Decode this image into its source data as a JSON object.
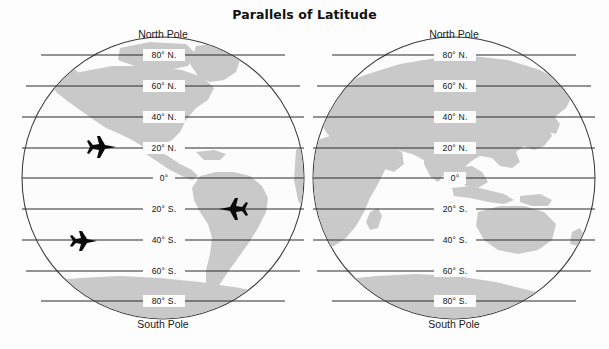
{
  "figure": {
    "title": "Parallels of Latitude",
    "background_color": "#fdfdfd",
    "land_color": "#c9c9c9",
    "ocean_color": "#fcfcfc",
    "line_color": "#2a2a2a"
  },
  "hemispheres": [
    {
      "id": "western",
      "name": "Western Hemisphere",
      "north_pole_label": "North Pole",
      "south_pole_label": "South Pole",
      "center_x": 163,
      "center_y": 178,
      "radius": 141,
      "parallels": [
        {
          "label": "80° N.",
          "latitude": 80
        },
        {
          "label": "60° N.",
          "latitude": 60
        },
        {
          "label": "40° N.",
          "latitude": 40
        },
        {
          "label": "20° N.",
          "latitude": 20
        },
        {
          "label": "0°",
          "latitude": 0
        },
        {
          "label": "20° S.",
          "latitude": -20
        },
        {
          "label": "40° S.",
          "latitude": -40
        },
        {
          "label": "60° S.",
          "latitude": -60
        },
        {
          "label": "80° S.",
          "latitude": -80
        }
      ]
    },
    {
      "id": "eastern",
      "name": "Eastern Hemisphere",
      "north_pole_label": "North Pole",
      "south_pole_label": "South Pole",
      "center_x": 454,
      "center_y": 178,
      "radius": 141,
      "parallels": [
        {
          "label": "80° N.",
          "latitude": 80
        },
        {
          "label": "60° N.",
          "latitude": 60
        },
        {
          "label": "40° N.",
          "latitude": 40
        },
        {
          "label": "20° N.",
          "latitude": 20
        },
        {
          "label": "0°",
          "latitude": 0
        },
        {
          "label": "20° S.",
          "latitude": -20
        },
        {
          "label": "40° S.",
          "latitude": -40
        },
        {
          "label": "60° S.",
          "latitude": -60
        },
        {
          "label": "80° S.",
          "latitude": -80
        }
      ]
    }
  ],
  "airplanes": [
    {
      "id": "plane-20n",
      "on_parallel": "20° N.",
      "heading": "east",
      "x": 103,
      "y": 147
    },
    {
      "id": "plane-20s",
      "on_parallel": "20° S.",
      "heading": "west",
      "x": 232,
      "y": 209
    },
    {
      "id": "plane-40s",
      "on_parallel": "40° S.",
      "heading": "east",
      "x": 85,
      "y": 241
    }
  ]
}
